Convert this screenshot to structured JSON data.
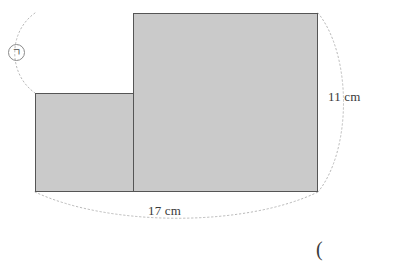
{
  "figure": {
    "type": "geometry-diagram",
    "outer_rectangle": {
      "width_label": "17 cm",
      "height_label": "11 cm",
      "fill_color": "#cacaca",
      "stroke_color": "#555555"
    },
    "unshaded_square": {
      "fill_color": "#ffffff",
      "stroke_color": "#555555"
    },
    "unknown_marker": {
      "symbol": "ㄱ",
      "shape": "circle",
      "stroke_color": "#8a8a8a"
    },
    "dimension_labels": [
      {
        "id": "height",
        "text": "11 cm",
        "position": "right"
      },
      {
        "id": "width",
        "text": "17 cm",
        "position": "bottom"
      }
    ],
    "stray_text": "("
  }
}
